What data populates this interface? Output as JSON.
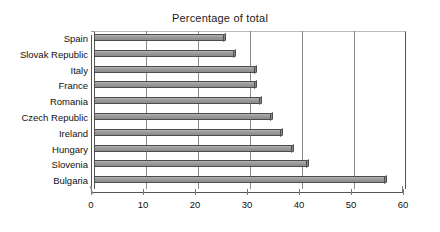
{
  "chart_data": {
    "type": "bar",
    "orientation": "horizontal",
    "title": "Percentage of total",
    "xlabel": "",
    "ylabel": "",
    "categories": [
      "Spain",
      "Slovak Republic",
      "Italy",
      "France",
      "Romania",
      "Czech Republic",
      "Ireland",
      "Hungary",
      "Slovenia",
      "Bulgaria"
    ],
    "values": [
      25,
      27,
      31,
      31,
      32,
      34,
      36,
      38,
      41,
      56
    ],
    "series": [
      {
        "name": "Percentage of total",
        "values": [
          25,
          27,
          31,
          31,
          32,
          34,
          36,
          38,
          41,
          56
        ]
      }
    ],
    "xlim": [
      0,
      60
    ],
    "xticks": [
      0,
      10,
      20,
      30,
      40,
      50,
      60
    ],
    "xtick_labels": [
      "0",
      "10",
      "20",
      "30",
      "40",
      "50",
      "60"
    ],
    "grid": "vertical",
    "legend": "none",
    "bar_color": "#9a9a9a",
    "bar_edge_color": "#4d4d4d",
    "axis_color": "#555555",
    "grid_color": "#8a8a8a",
    "background": "#ffffff",
    "style_3d": true
  }
}
